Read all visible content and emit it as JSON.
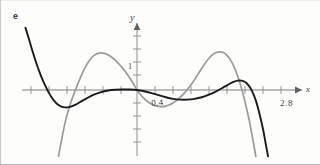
{
  "figure": {
    "panel_label": "e",
    "axis_labels": {
      "x": "x",
      "y": "y"
    },
    "annotations": [
      {
        "name": "y-tick-one",
        "text": "1"
      },
      {
        "name": "root-left-label",
        "text": "0.4"
      },
      {
        "name": "root-right-label",
        "text": "2.8"
      }
    ]
  },
  "chart_data": {
    "type": "line",
    "title": "",
    "xlabel": "x",
    "ylabel": "y",
    "grid": false,
    "legend": "none",
    "xlim": [
      -3.6,
      4.4
    ],
    "ylim": [
      -2.6,
      2.4
    ],
    "x_ticks": [
      -3,
      -2.5,
      -2,
      -1.5,
      -1,
      -0.5,
      0.5,
      1,
      1.5,
      2,
      2.5,
      3,
      3.5
    ],
    "y_ticks": [
      -2.5,
      -2,
      -1.5,
      -1,
      -0.5,
      0.5,
      1,
      1.5,
      2
    ],
    "labeled_ticks": [
      {
        "axis": "y",
        "value": 1,
        "label": "1"
      },
      {
        "axis": "x",
        "value": 0.4,
        "label": "0.4"
      },
      {
        "axis": "x",
        "value": 2.8,
        "label": "2.8"
      }
    ],
    "series": [
      {
        "name": "dark-curve",
        "color": "#1b1b1b",
        "width": 1.9,
        "description": "quartic-like curve: steep descent from upper left, local minimum near x=-2.1, rises through origin, dips to local minimum near x=1.2, rises to local maximum near x=2.8, then plunges steeply down at the right",
        "points": [
          [
            -3.1,
            2.4
          ],
          [
            -3.0,
            1.95
          ],
          [
            -2.9,
            1.48
          ],
          [
            -2.8,
            1.05
          ],
          [
            -2.7,
            0.66
          ],
          [
            -2.6,
            0.32
          ],
          [
            -2.5,
            0.03
          ],
          [
            -2.45,
            -0.1
          ],
          [
            -2.4,
            -0.22
          ],
          [
            -2.3,
            -0.42
          ],
          [
            -2.2,
            -0.56
          ],
          [
            -2.1,
            -0.64
          ],
          [
            -2.0,
            -0.67
          ],
          [
            -1.9,
            -0.66
          ],
          [
            -1.8,
            -0.62
          ],
          [
            -1.7,
            -0.56
          ],
          [
            -1.6,
            -0.48
          ],
          [
            -1.5,
            -0.4
          ],
          [
            -1.4,
            -0.32
          ],
          [
            -1.2,
            -0.18
          ],
          [
            -1.0,
            -0.08
          ],
          [
            -0.8,
            -0.02
          ],
          [
            -0.6,
            0.01
          ],
          [
            -0.4,
            0.02
          ],
          [
            -0.2,
            0.02
          ],
          [
            0.0,
            0.0
          ],
          [
            0.2,
            -0.05
          ],
          [
            0.4,
            -0.12
          ],
          [
            0.6,
            -0.2
          ],
          [
            0.8,
            -0.28
          ],
          [
            1.0,
            -0.34
          ],
          [
            1.2,
            -0.37
          ],
          [
            1.4,
            -0.37
          ],
          [
            1.6,
            -0.34
          ],
          [
            1.8,
            -0.28
          ],
          [
            2.0,
            -0.18
          ],
          [
            2.2,
            -0.05
          ],
          [
            2.4,
            0.1
          ],
          [
            2.55,
            0.22
          ],
          [
            2.7,
            0.32
          ],
          [
            2.8,
            0.36
          ],
          [
            2.9,
            0.36
          ],
          [
            3.0,
            0.31
          ],
          [
            3.1,
            0.18
          ],
          [
            3.2,
            -0.05
          ],
          [
            3.3,
            -0.4
          ],
          [
            3.4,
            -0.9
          ],
          [
            3.5,
            -1.5
          ],
          [
            3.58,
            -2.1
          ],
          [
            3.64,
            -2.55
          ]
        ]
      },
      {
        "name": "gray-curve",
        "color": "#9a9a9a",
        "width": 1.7,
        "description": "lighter quartic-like curve: rises steeply from lower left, local maximum near x=-1.3, falls through origin to local minimum near x=0.7, rises to local maximum near x=2.3, then plunges steeply down at the right",
        "points": [
          [
            -2.18,
            -2.55
          ],
          [
            -2.12,
            -2.1
          ],
          [
            -2.05,
            -1.6
          ],
          [
            -1.98,
            -1.15
          ],
          [
            -1.9,
            -0.75
          ],
          [
            -1.82,
            -0.4
          ],
          [
            -1.74,
            -0.1
          ],
          [
            -1.66,
            0.18
          ],
          [
            -1.58,
            0.45
          ],
          [
            -1.5,
            0.7
          ],
          [
            -1.42,
            0.92
          ],
          [
            -1.34,
            1.1
          ],
          [
            -1.26,
            1.24
          ],
          [
            -1.18,
            1.34
          ],
          [
            -1.1,
            1.4
          ],
          [
            -1.0,
            1.43
          ],
          [
            -0.9,
            1.41
          ],
          [
            -0.8,
            1.35
          ],
          [
            -0.7,
            1.26
          ],
          [
            -0.6,
            1.14
          ],
          [
            -0.5,
            1.0
          ],
          [
            -0.4,
            0.84
          ],
          [
            -0.3,
            0.66
          ],
          [
            -0.2,
            0.46
          ],
          [
            -0.1,
            0.24
          ],
          [
            0.0,
            0.0
          ],
          [
            0.1,
            -0.18
          ],
          [
            0.2,
            -0.33
          ],
          [
            0.3,
            -0.45
          ],
          [
            0.4,
            -0.54
          ],
          [
            0.5,
            -0.6
          ],
          [
            0.6,
            -0.63
          ],
          [
            0.7,
            -0.64
          ],
          [
            0.8,
            -0.62
          ],
          [
            0.9,
            -0.57
          ],
          [
            1.0,
            -0.5
          ],
          [
            1.1,
            -0.4
          ],
          [
            1.2,
            -0.28
          ],
          [
            1.3,
            -0.14
          ],
          [
            1.4,
            0.02
          ],
          [
            1.5,
            0.2
          ],
          [
            1.6,
            0.4
          ],
          [
            1.7,
            0.62
          ],
          [
            1.8,
            0.84
          ],
          [
            1.9,
            1.04
          ],
          [
            2.0,
            1.22
          ],
          [
            2.1,
            1.36
          ],
          [
            2.2,
            1.44
          ],
          [
            2.3,
            1.47
          ],
          [
            2.4,
            1.44
          ],
          [
            2.5,
            1.33
          ],
          [
            2.6,
            1.15
          ],
          [
            2.7,
            0.88
          ],
          [
            2.8,
            0.52
          ],
          [
            2.9,
            0.08
          ],
          [
            3.0,
            -0.45
          ],
          [
            3.1,
            -1.05
          ],
          [
            3.18,
            -1.62
          ],
          [
            3.25,
            -2.15
          ],
          [
            3.3,
            -2.55
          ]
        ]
      }
    ]
  }
}
